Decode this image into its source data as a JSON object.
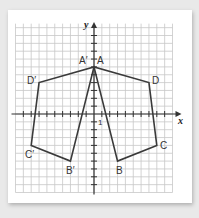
{
  "diagram": {
    "type": "coordinate-grid-reflection",
    "axes": {
      "x_label": "x",
      "y_label": "y",
      "unit_label": "1"
    },
    "grid": {
      "x_range": [
        -10,
        10
      ],
      "y_range": [
        -10,
        11
      ],
      "spacing_px": 7.85
    },
    "shapes": [
      {
        "name": "ABCD",
        "vertices": {
          "A": [
            0,
            6
          ],
          "B": [
            3,
            -6
          ],
          "C": [
            8,
            -4
          ],
          "D": [
            7,
            4
          ]
        }
      },
      {
        "name": "A'B'C'D'",
        "vertices": {
          "A'": [
            0,
            6
          ],
          "B'": [
            -3,
            -6
          ],
          "C'": [
            -8,
            -4
          ],
          "D'": [
            -7,
            4
          ]
        }
      }
    ],
    "labels": {
      "A": "A",
      "B": "B",
      "C": "C",
      "D": "D",
      "A_prime": "A′",
      "B_prime": "B′",
      "C_prime": "C′",
      "D_prime": "D′"
    },
    "colors": {
      "grid": "#c8c8c8",
      "axis": "#333333",
      "shape": "#3a3a3a",
      "background": "#ffffff"
    }
  }
}
